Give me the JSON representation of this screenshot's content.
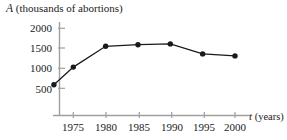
{
  "chart_data": {
    "type": "line",
    "title": "",
    "ylabel": "A (thousands of abortions)",
    "ylabel_symbol": "A",
    "ylabel_unit": "(thousands of abortions)",
    "xlabel": "t (years)",
    "xlabel_symbol": "t",
    "xlabel_unit": "(years)",
    "x": [
      1972,
      1975,
      1980,
      1985,
      1990,
      1995,
      2000
    ],
    "values": [
      590,
      1030,
      1550,
      1590,
      1610,
      1360,
      1310
    ],
    "series": [
      {
        "name": "A",
        "values": [
          590,
          1030,
          1550,
          1590,
          1610,
          1360,
          1310
        ]
      }
    ],
    "xticks": [
      1975,
      1980,
      1985,
      1990,
      1995,
      2000
    ],
    "xtick_labels": [
      "1975",
      "1980",
      "1985",
      "1990",
      "1995",
      "2000"
    ],
    "yticks": [
      500,
      1000,
      1500,
      2000
    ],
    "ytick_labels": [
      "500",
      "1000",
      "1500",
      "2000"
    ],
    "xlim": [
      1971,
      2002
    ],
    "ylim": [
      0,
      2150
    ],
    "grid": false,
    "legend": "none",
    "marker": "filled-circle",
    "line_color": "#1a1a1a",
    "marker_color": "#1a1a1a",
    "axis_color": "#999999",
    "background": "#ffffff"
  }
}
